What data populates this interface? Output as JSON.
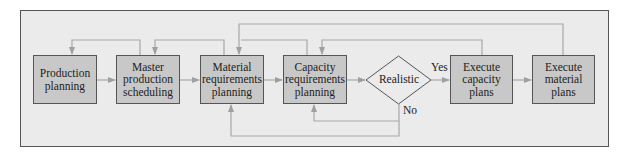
{
  "diagram": {
    "type": "flowchart",
    "nodes": [
      {
        "id": "production_planning",
        "label": "Production planning",
        "shape": "rect"
      },
      {
        "id": "master_production_scheduling",
        "label": "Master production scheduling",
        "shape": "rect"
      },
      {
        "id": "material_requirements_planning",
        "label": "Material requirements planning",
        "shape": "rect"
      },
      {
        "id": "capacity_requirements_planning",
        "label": "Capacity requirements planning",
        "shape": "rect"
      },
      {
        "id": "realistic",
        "label": "Realistic",
        "shape": "diamond"
      },
      {
        "id": "execute_capacity_plans",
        "label": "Execute capacity plans",
        "shape": "rect"
      },
      {
        "id": "execute_material_plans",
        "label": "Execute material plans",
        "shape": "rect"
      }
    ],
    "edges": [
      {
        "from": "production_planning",
        "to": "master_production_scheduling"
      },
      {
        "from": "master_production_scheduling",
        "to": "material_requirements_planning"
      },
      {
        "from": "material_requirements_planning",
        "to": "capacity_requirements_planning"
      },
      {
        "from": "capacity_requirements_planning",
        "to": "realistic"
      },
      {
        "from": "realistic",
        "to": "execute_capacity_plans",
        "label": "Yes"
      },
      {
        "from": "execute_capacity_plans",
        "to": "execute_material_plans"
      },
      {
        "from": "realistic",
        "to": "capacity_requirements_planning",
        "label": "No"
      },
      {
        "from": "realistic",
        "to": "material_requirements_planning",
        "label": "No"
      },
      {
        "from": "master_production_scheduling",
        "to": "production_planning",
        "type": "feedback"
      },
      {
        "from": "material_requirements_planning",
        "to": "master_production_scheduling",
        "type": "feedback"
      },
      {
        "from": "capacity_requirements_planning",
        "to": "material_requirements_planning",
        "type": "feedback"
      },
      {
        "from": "execute_capacity_plans",
        "to": "capacity_requirements_planning",
        "type": "feedback"
      },
      {
        "from": "execute_material_plans",
        "to": "material_requirements_planning",
        "type": "feedback"
      }
    ],
    "labels": {
      "pp_1": "Production",
      "pp_2": "planning",
      "mps_1": "Master",
      "mps_2": "production",
      "mps_3": "scheduling",
      "mrp_1": "Material",
      "mrp_2": "requirements",
      "mrp_3": "planning",
      "crp_1": "Capacity",
      "crp_2": "requirements",
      "crp_3": "planning",
      "realistic": "Realistic",
      "ecp_1": "Execute",
      "ecp_2": "capacity",
      "ecp_3": "plans",
      "emp_1": "Execute",
      "emp_2": "material",
      "emp_3": "plans",
      "yes": "Yes",
      "no": "No"
    },
    "colors": {
      "frame_bg": "#ebebeb",
      "box_fill": "#c8c8c8",
      "border": "#555555",
      "connector": "#a8a8a8"
    }
  }
}
